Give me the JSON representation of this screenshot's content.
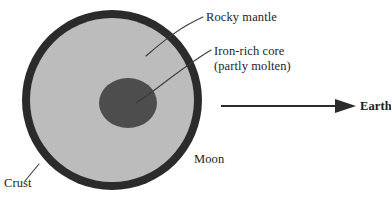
{
  "diagram": {
    "subject": "Moon",
    "labels": {
      "rocky_mantle": "Rocky mantle",
      "iron_core_line1": "Iron-rich core",
      "iron_core_line2": "(partly molten)",
      "moon": "Moon",
      "crust": "Crust",
      "earth": "Earth"
    },
    "layers": [
      {
        "name": "crust",
        "label": "Crust",
        "color": "#2b2b2b"
      },
      {
        "name": "rocky-mantle",
        "label": "Rocky mantle",
        "color": "#bcbcbc"
      },
      {
        "name": "iron-rich-core",
        "label": "Iron-rich core (partly molten)",
        "color": "#4d4d4d"
      }
    ],
    "arrow": {
      "label": "Earth",
      "direction": "right",
      "color": "#2b2b2b"
    },
    "colors": {
      "background": "#ffffff",
      "crust": "#2b2b2b",
      "mantle": "#bcbcbc",
      "core": "#4d4d4d",
      "leader_line": "#3a3a3a",
      "text": "#1d1d1d"
    },
    "geometry": {
      "moon_center_x": 112,
      "moon_center_y": 100,
      "moon_outer_radius": 91,
      "crust_thickness": 8,
      "core_radius_x": 29,
      "core_radius_y": 25,
      "core_center_x": 128,
      "core_center_y": 103
    }
  }
}
